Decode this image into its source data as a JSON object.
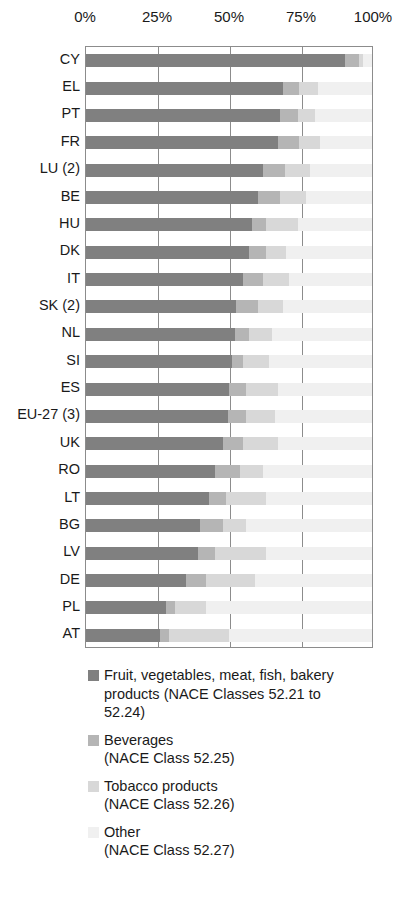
{
  "chart_data": {
    "type": "bar",
    "orientation": "horizontal",
    "stacked": true,
    "percent": true,
    "title": "",
    "subtitle": "",
    "xlabel": "",
    "ylabel": "",
    "xlim": [
      0,
      100
    ],
    "grid": true,
    "legend_position": "bottom",
    "tick_labels": [
      "0%",
      "25%",
      "50%",
      "75%",
      "100%"
    ],
    "tick_values": [
      0,
      25,
      50,
      75,
      100
    ],
    "categories": [
      "CY",
      "EL",
      "PT",
      "FR",
      "LU (2)",
      "BE",
      "HU",
      "DK",
      "IT",
      "SK (2)",
      "NL",
      "SI",
      "ES",
      "EU-27 (3)",
      "UK",
      "RO",
      "LT",
      "BG",
      "LV",
      "DE",
      "PL",
      "AT"
    ],
    "series": [
      {
        "name": "Fruit, vegetables, meat, fish, bakery products (NACE Classes 52.21 to 52.24)",
        "color": "#808080",
        "values": [
          90.5,
          69.0,
          68.0,
          67.0,
          62.0,
          60.0,
          58.0,
          57.0,
          55.0,
          52.5,
          52.0,
          51.0,
          50.0,
          49.5,
          48.0,
          45.0,
          43.0,
          40.0,
          39.0,
          35.0,
          28.0,
          26.0
        ]
      },
      {
        "name": "Beverages (NACE Class 52.25)",
        "color": "#b5b5b5",
        "values": [
          5.0,
          5.5,
          6.0,
          7.5,
          7.5,
          8.0,
          5.0,
          6.0,
          7.0,
          7.5,
          5.0,
          4.0,
          6.0,
          6.5,
          7.0,
          9.0,
          6.0,
          8.0,
          6.0,
          7.0,
          3.0,
          3.0
        ]
      },
      {
        "name": "Tobacco products (NACE Class 52.26)",
        "color": "#d8d8d8",
        "values": [
          1.5,
          6.5,
          6.0,
          7.5,
          9.0,
          9.0,
          11.0,
          7.0,
          9.0,
          9.0,
          8.0,
          9.0,
          11.0,
          10.0,
          12.0,
          8.0,
          14.0,
          8.0,
          18.0,
          17.0,
          11.0,
          21.0
        ]
      },
      {
        "name": "Other (NACE Class 52.27)",
        "color": "#f0f0f0",
        "values": [
          3.0,
          19.0,
          20.0,
          18.0,
          21.5,
          23.0,
          26.0,
          30.0,
          29.0,
          31.0,
          35.0,
          36.0,
          33.0,
          34.0,
          33.0,
          38.0,
          37.0,
          44.0,
          37.0,
          41.0,
          58.0,
          50.0
        ]
      }
    ]
  },
  "legend": {
    "items": [
      {
        "label": "Fruit, vegetables, meat, fish, bakery\nproducts (NACE Classes 52.21 to\n52.24)",
        "color": "#808080"
      },
      {
        "label": "Beverages\n(NACE Class 52.25)",
        "color": "#b5b5b5"
      },
      {
        "label": "Tobacco products\n(NACE Class 52.26)",
        "color": "#d8d8d8"
      },
      {
        "label": "Other\n(NACE Class 52.27)",
        "color": "#f0f0f0"
      }
    ]
  }
}
